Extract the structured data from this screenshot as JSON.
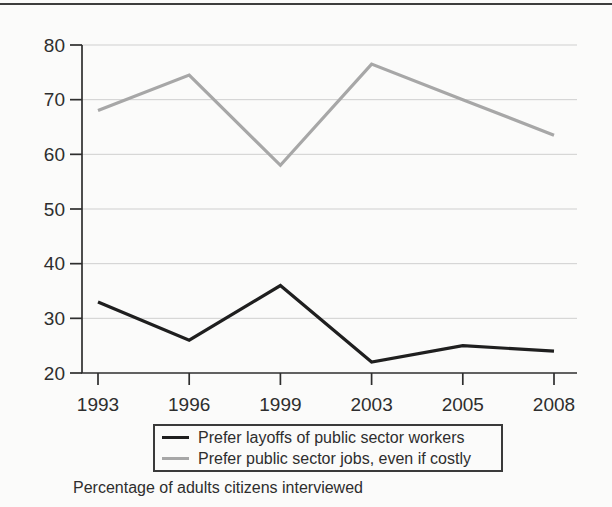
{
  "page": {
    "background": "#fbfbfa",
    "top_rule_color": "#3d3d3d"
  },
  "chart_data": {
    "type": "line",
    "title": "",
    "xlabel": "",
    "ylabel": "",
    "categories": [
      "1993",
      "1996",
      "1999",
      "2003",
      "2005",
      "2008"
    ],
    "series": [
      {
        "name": "Prefer layoffs of public sector workers",
        "color": "#1f1f1f",
        "values": [
          33,
          26,
          36,
          22,
          25,
          24
        ]
      },
      {
        "name": "Prefer public sector jobs, even if costly",
        "color": "#a7a7a7",
        "values": [
          68,
          74.5,
          58,
          76.5,
          70,
          63.5
        ]
      }
    ],
    "ylim": [
      20,
      80
    ],
    "yticks": [
      20,
      30,
      40,
      50,
      60,
      70,
      80
    ],
    "grid": "horizontal gridlines at each y tick",
    "gridline_color": "#cfcfcf",
    "axis_color": "#2e2e2e",
    "tick_label_color": "#2e2e2e",
    "legend_position": "bottom-center, boxed",
    "caption": "Percentage of adults citizens interviewed"
  }
}
